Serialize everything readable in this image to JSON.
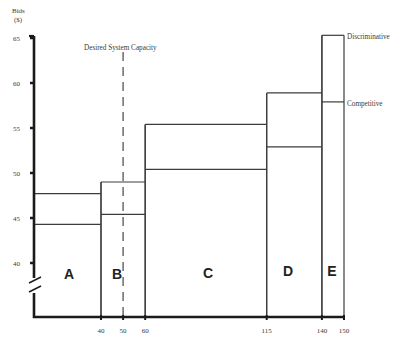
{
  "chart_data": {
    "type": "bar",
    "subtype": "variable-width step bars (two overlaid levels per segment)",
    "title": "",
    "xlabel": "",
    "ylabel": "Bids ($)",
    "y_label_lines": [
      "Bids",
      "($)"
    ],
    "ylim": [
      40,
      65
    ],
    "y_axis_break": true,
    "y_ticks": [
      65,
      60,
      55,
      50,
      45,
      40
    ],
    "x_ticks": [
      40,
      50,
      60,
      115,
      140,
      150
    ],
    "grid": false,
    "legend": {
      "position": "right-inline",
      "entries": [
        "Discriminative",
        "Competitive"
      ]
    },
    "annotation": {
      "text": "Desired System Capacity",
      "x": 50,
      "style": "dashed vertical line"
    },
    "segments": [
      {
        "label": "A",
        "x_start": 10,
        "x_end": 40,
        "discriminative": 47.7,
        "competitive": 44.3
      },
      {
        "label": "B",
        "x_start": 40,
        "x_end": 60,
        "discriminative": 49.0,
        "competitive": 45.4
      },
      {
        "label": "C",
        "x_start": 60,
        "x_end": 115,
        "discriminative": 55.4,
        "competitive": 50.4
      },
      {
        "label": "D",
        "x_start": 115,
        "x_end": 140,
        "discriminative": 58.9,
        "competitive": 52.9
      },
      {
        "label": "E",
        "x_start": 140,
        "x_end": 150,
        "discriminative": 65.3,
        "competitive": 57.9
      }
    ],
    "series": [
      {
        "name": "Discriminative",
        "values": [
          47.7,
          49.0,
          55.4,
          58.9,
          65.3
        ]
      },
      {
        "name": "Competitive",
        "values": [
          44.3,
          45.4,
          50.4,
          52.9,
          57.9
        ]
      }
    ],
    "categories": [
      "A",
      "B",
      "C",
      "D",
      "E"
    ],
    "colors": {
      "line": "#3c3c3c",
      "axis": "#1a1a1a",
      "text": "#3a3a3a",
      "background": "#ffffff"
    }
  }
}
